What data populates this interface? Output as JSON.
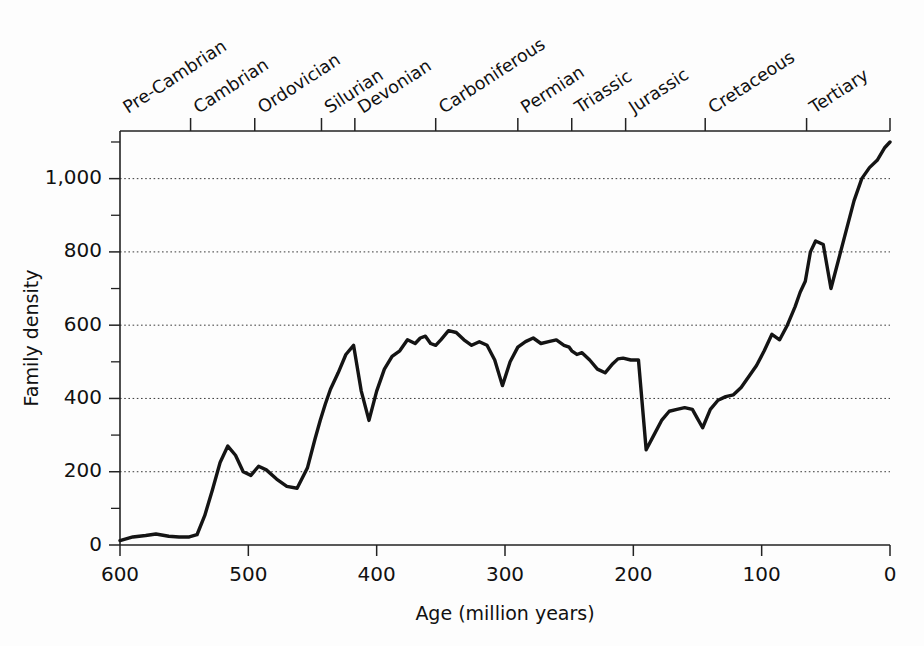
{
  "chart_data": {
    "type": "line",
    "title": "",
    "xlabel": "Age (million years)",
    "ylabel": "Family density",
    "xlim": [
      600,
      0
    ],
    "ylim": [
      0,
      1130
    ],
    "x_reversed": true,
    "grid": "horizontal dotted at major y ticks",
    "legend": "none",
    "x_ticks_major": [
      600,
      500,
      400,
      300,
      200,
      100,
      0
    ],
    "x_tick_labels": [
      "600",
      "500",
      "400",
      "300",
      "200",
      "100",
      "0"
    ],
    "y_ticks_major": [
      0,
      200,
      400,
      600,
      800,
      1000
    ],
    "y_tick_labels": [
      "0",
      "200",
      "400",
      "600",
      "800",
      "1,000"
    ],
    "y_ticks_minor": [
      100,
      300,
      500,
      700,
      900,
      1100
    ],
    "series": [
      {
        "name": "Family density",
        "x": [
          600,
          590,
          580,
          572,
          562,
          554,
          546,
          540,
          534,
          528,
          522,
          516,
          510,
          504,
          498,
          492,
          486,
          478,
          470,
          462,
          454,
          448,
          444,
          440,
          436,
          430,
          424,
          418,
          412,
          406,
          400,
          394,
          388,
          382,
          376,
          370,
          366,
          362,
          358,
          354,
          350,
          344,
          338,
          332,
          326,
          320,
          314,
          308,
          302,
          296,
          290,
          284,
          278,
          272,
          266,
          260,
          254,
          250,
          248,
          244,
          240,
          234,
          228,
          222,
          216,
          212,
          208,
          202,
          196,
          190,
          184,
          178,
          172,
          166,
          160,
          154,
          150,
          146,
          140,
          134,
          128,
          122,
          116,
          110,
          104,
          98,
          92,
          86,
          80,
          74,
          70,
          66,
          64,
          62,
          58,
          52,
          46,
          40,
          34,
          28,
          22,
          16,
          10,
          4,
          0
        ],
        "y": [
          12,
          22,
          26,
          30,
          24,
          22,
          22,
          28,
          80,
          150,
          225,
          270,
          245,
          200,
          190,
          215,
          205,
          180,
          160,
          155,
          210,
          290,
          340,
          385,
          425,
          470,
          520,
          545,
          420,
          340,
          420,
          480,
          515,
          530,
          560,
          550,
          565,
          570,
          550,
          545,
          560,
          585,
          580,
          560,
          545,
          555,
          545,
          505,
          435,
          500,
          540,
          555,
          565,
          550,
          555,
          560,
          545,
          540,
          530,
          520,
          525,
          505,
          480,
          470,
          495,
          508,
          510,
          505,
          505,
          260,
          300,
          340,
          365,
          370,
          375,
          370,
          345,
          320,
          370,
          395,
          405,
          410,
          430,
          460,
          490,
          530,
          575,
          560,
          600,
          650,
          690,
          720,
          760,
          800,
          830,
          820,
          700,
          780,
          860,
          940,
          1000,
          1030,
          1050,
          1085,
          1100
        ],
        "color": "#141414",
        "linewidth": 3.4
      }
    ],
    "annotations": {
      "description": "Marine family diversity through the Phanerozoic; sharp drops at end-Ordovician (~440 Ma), late Devonian (~365 Ma), end-Permian (~250 Ma) and end-Cretaceous (~65 Ma)."
    }
  },
  "top_axis": {
    "name": "geologic-periods-axis",
    "periods": [
      {
        "label": "Pre-Cambrian",
        "start_ma": 600,
        "end_ma": 545,
        "tick_at_ma": 545
      },
      {
        "label": "Cambrian",
        "start_ma": 545,
        "end_ma": 495,
        "tick_at_ma": 495
      },
      {
        "label": "Ordovician",
        "start_ma": 495,
        "end_ma": 443,
        "tick_at_ma": 443
      },
      {
        "label": "Silurian",
        "start_ma": 443,
        "end_ma": 417,
        "tick_at_ma": 417
      },
      {
        "label": "Devonian",
        "start_ma": 417,
        "end_ma": 354,
        "tick_at_ma": 354
      },
      {
        "label": "Carboniferous",
        "start_ma": 354,
        "end_ma": 290,
        "tick_at_ma": 290
      },
      {
        "label": "Permian",
        "start_ma": 290,
        "end_ma": 248,
        "tick_at_ma": 248
      },
      {
        "label": "Triassic",
        "start_ma": 248,
        "end_ma": 206,
        "tick_at_ma": 206
      },
      {
        "label": "Jurassic",
        "start_ma": 206,
        "end_ma": 144,
        "tick_at_ma": 144
      },
      {
        "label": "Cretaceous",
        "start_ma": 144,
        "end_ma": 65,
        "tick_at_ma": 65
      },
      {
        "label": "Tertiary",
        "start_ma": 65,
        "end_ma": 0,
        "tick_at_ma": 0
      }
    ]
  },
  "colors": {
    "background": "#fdfdfd",
    "axis": "#222222",
    "line": "#141414",
    "grid": "#3a3a3a",
    "text": "#111111"
  }
}
